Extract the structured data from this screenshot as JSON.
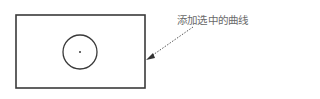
{
  "diagram": {
    "annotation_label": "添加选中的曲线",
    "colors": {
      "stroke": "#3a3a3a",
      "annotation_text": "#6a6a6a",
      "arrow": "#444444"
    },
    "shapes": {
      "rectangle": {
        "x": 16,
        "y": 15,
        "width": 129,
        "height": 73
      },
      "circle": {
        "cx": 80,
        "cy": 52,
        "r": 17
      },
      "center_point": {
        "cx": 80,
        "cy": 52
      }
    }
  }
}
